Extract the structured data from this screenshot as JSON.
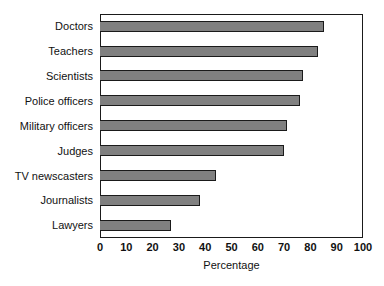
{
  "chart_data": {
    "type": "bar",
    "orientation": "horizontal",
    "title": "",
    "xlabel": "Percentage",
    "ylabel": "",
    "xlim": [
      0,
      100
    ],
    "xticks": [
      "0",
      "10",
      "20",
      "30",
      "40",
      "50",
      "60",
      "70",
      "80",
      "90",
      "100"
    ],
    "grid": false,
    "legend": false,
    "categories": [
      "Doctors",
      "Teachers",
      "Scientists",
      "Police officers",
      "Military officers",
      "Judges",
      "TV newscasters",
      "Journalists",
      "Lawyers"
    ],
    "values": [
      85,
      83,
      77,
      76,
      71,
      70,
      44,
      38,
      27
    ],
    "bar_color": "#808080",
    "bar_edge_color": "#1a1a1a",
    "background_color": "#ffffff"
  }
}
